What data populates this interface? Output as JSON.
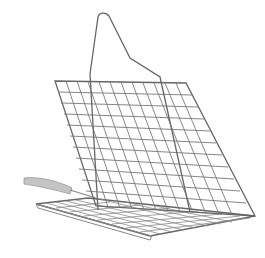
{
  "image": {
    "subject": "grill basket",
    "background_color": "#ffffff",
    "wire_color": "#6e6e6e",
    "handle_grip_color": "#b0b0b0"
  }
}
